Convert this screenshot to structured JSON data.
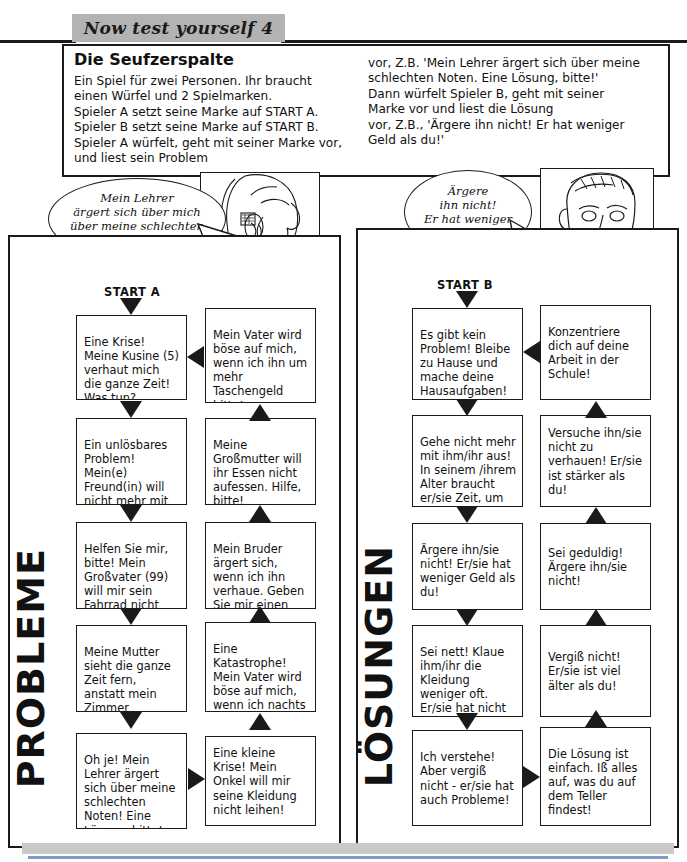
{
  "header": {
    "banner_label": "Now test yourself 4"
  },
  "intro": {
    "title": "Die Seufzerspalte",
    "left_text": "Ein Spiel für zwei Personen. Ihr braucht\neinen Würfel und 2 Spielmarken.\nSpieler A setzt seine Marke auf START A.\nSpieler B setzt seine Marke auf START B.\nSpieler A würfelt, geht mit seiner Marke vor,\nund liest sein Problem",
    "right_text": "vor, Z.B. 'Mein Lehrer ärgert sich über meine\nschlechten Noten. Eine Lösung, bitte!'\nDann würfelt Spieler B, geht mit seiner\nMarke vor und liest die Lösung\nvor, Z.B., 'Ärgere ihn nicht! Er hat weniger\nGeld als du!'"
  },
  "bubbles": {
    "girl": "Mein Lehrer\närgert sich über mich\nüber meine schlechten\nNoten!",
    "boy": "Ärgere\nihn nicht!\nEr hat weniger\nGeld als du!"
  },
  "portraits": {
    "girl_alt": "girl-portrait-illustration",
    "boy_alt": "boy-portrait-illustration"
  },
  "columns": {
    "left": {
      "side_word": "PROBLEME",
      "start_label": "START A",
      "boxes": [
        "Eine Krise! Meine Kusine (5) verhaut mich die ganze Zeit! Was tun?",
        "Mein Vater wird böse auf mich, wenn ich ihn um mehr Taschengeld bitte!",
        "Ein unlösbares Problem! Mein(e) Freund(in) will nicht mehr mit mir ausgehen!",
        "Meine Großmutter will ihr Essen nicht aufessen. Hilfe, bitte!",
        "Helfen Sie mir, bitte! Mein Großvater (99) will mir sein Fahrrad nicht leihen!",
        "Mein Bruder ärgert sich, wenn ich ihn verhaue. Geben Sie mir einen Rat!",
        "Meine Mutter sieht die ganze Zeit fern, anstatt mein Zimmer aufzuräumen!",
        "Eine Katastrophe! Mein Vater wird böse auf mich, wenn ich nachts um 2.00 Uhr nach Hause komme!",
        "Oh je! Mein Lehrer ärgert sich über meine schlechten Noten! Eine Lösung, bitte!",
        "Eine kleine Krise! Mein Onkel will mir seine Kleidung nicht leihen!"
      ]
    },
    "right": {
      "side_word": "LÖSUNGEN",
      "start_label": "START B",
      "boxes": [
        "Es gibt kein Problem! Bleibe zu Hause und mache deine Hausaufgaben!",
        "Konzentriere dich auf deine Arbeit in der Schule!",
        "Gehe nicht mehr mit ihm/ihr aus! In seinem /ihrem Alter braucht er/sie Zeit, um sich auszuruhen!",
        "Versuche ihn/sie nicht zu verhauen! Er/sie ist stärker als du!",
        "Ärgere ihn/sie nicht! Er/sie hat weniger Geld als du!",
        "Sei geduldig! Ärgere ihn/sie nicht!",
        "Sei nett! Klaue ihm/ihr die Kleidung weniger oft. Er/sie hat nicht viel!",
        "Vergiß nicht! Er/sie ist viel älter als du!",
        "Ich verstehe! Aber vergiß nicht - er/sie hat auch Probleme!",
        "Die Lösung ist einfach. Iß alles auf, was du auf dem Teller findest!"
      ]
    }
  },
  "colors": {
    "banner_gray": "#b3b3b3",
    "ink": "#1a1a1a",
    "footer_gray": "#c9c9c9",
    "footer_rule_blue": "#7f9dc4"
  }
}
